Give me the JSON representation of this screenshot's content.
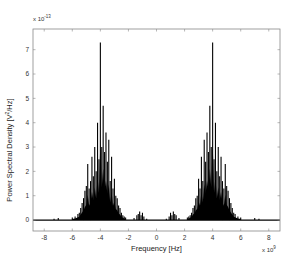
{
  "chart_data": {
    "type": "bar",
    "title": "",
    "xlabel": "Frequency [Hz]",
    "ylabel": "Power Spectral Density [V^2/Hz]",
    "x_multiplier_label": "x 10^9",
    "y_multiplier_label": "x 10^-13",
    "xlim": [
      -8.8,
      8.8
    ],
    "ylim": [
      -0.45,
      7.85
    ],
    "x_ticks": [
      -8,
      -6,
      -4,
      -2,
      0,
      2,
      4,
      6,
      8
    ],
    "y_ticks": [
      0,
      1,
      2,
      3,
      4,
      5,
      6,
      7
    ],
    "grid": false,
    "legend": null,
    "series": [
      {
        "name": "PSD",
        "color": "#000000",
        "x": [
          -7.3,
          -7.0,
          -6.0,
          -5.8,
          -5.6,
          -5.5,
          -5.4,
          -5.3,
          -5.2,
          -5.1,
          -5.0,
          -4.9,
          -4.8,
          -4.7,
          -4.6,
          -4.5,
          -4.4,
          -4.3,
          -4.2,
          -4.1,
          -4.0,
          -3.9,
          -3.8,
          -3.7,
          -3.6,
          -3.5,
          -3.4,
          -3.3,
          -3.2,
          -3.1,
          -3.0,
          -2.9,
          -2.8,
          -2.7,
          -2.6,
          -2.5,
          -2.4,
          -2.3,
          -2.2,
          -1.6,
          -1.4,
          -1.3,
          -1.2,
          -1.1,
          -1.0,
          -0.9,
          -0.7,
          0.7,
          0.9,
          1.0,
          1.1,
          1.2,
          1.3,
          1.4,
          1.6,
          2.2,
          2.3,
          2.4,
          2.5,
          2.6,
          2.7,
          2.8,
          2.9,
          3.0,
          3.1,
          3.2,
          3.3,
          3.4,
          3.5,
          3.6,
          3.7,
          3.8,
          3.9,
          4.0,
          4.1,
          4.2,
          4.3,
          4.4,
          4.5,
          4.6,
          4.7,
          4.8,
          4.9,
          5.0,
          5.1,
          5.2,
          5.3,
          5.4,
          5.5,
          5.6,
          5.8,
          6.0,
          7.0,
          7.3
        ],
        "values": [
          0.05,
          0.08,
          0.1,
          0.15,
          0.25,
          0.3,
          0.5,
          0.7,
          0.9,
          1.2,
          1.4,
          2.3,
          1.3,
          1.6,
          2.6,
          1.8,
          3.0,
          2.0,
          4.0,
          2.5,
          7.3,
          3.0,
          4.7,
          2.8,
          3.6,
          2.4,
          3.3,
          1.6,
          2.6,
          1.3,
          1.7,
          1.0,
          0.9,
          0.6,
          0.5,
          0.3,
          0.2,
          0.15,
          0.1,
          0.08,
          0.2,
          0.25,
          0.35,
          0.2,
          0.3,
          0.15,
          0.05,
          0.05,
          0.15,
          0.3,
          0.2,
          0.35,
          0.25,
          0.2,
          0.08,
          0.1,
          0.15,
          0.2,
          0.3,
          0.5,
          0.6,
          0.9,
          1.0,
          1.7,
          1.3,
          2.6,
          1.6,
          3.3,
          2.4,
          3.6,
          2.8,
          4.7,
          3.0,
          7.3,
          2.5,
          4.0,
          2.0,
          3.0,
          1.8,
          2.6,
          1.6,
          1.3,
          2.3,
          1.4,
          1.2,
          0.9,
          0.7,
          0.5,
          0.3,
          0.25,
          0.15,
          0.1,
          0.08,
          0.05
        ]
      }
    ]
  },
  "layout": {
    "plot_left": 33,
    "plot_right": 280,
    "plot_top": 29,
    "plot_bottom": 231,
    "axis_color": "#888888",
    "bar_color": "#000000"
  }
}
